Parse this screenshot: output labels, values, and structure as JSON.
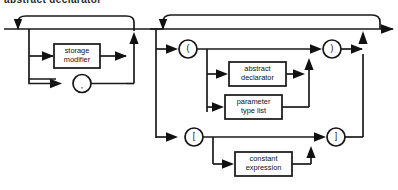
{
  "diagram": {
    "title": "abstract declarator",
    "type": "railroad-syntax-diagram",
    "ink_color": "#151515",
    "background_color": "#ffffff",
    "nodes": {
      "storage_modifier": "storage\nmodifier",
      "storage_modifier_line1": "storage",
      "storage_modifier_line2": "modifier",
      "abstract_declarator_line1": "abstract",
      "abstract_declarator_line2": "declarator",
      "parameter_type_list_line1": "parameter",
      "parameter_type_list_line2": "type list",
      "constant_expression_line1": "constant",
      "constant_expression_line2": "expression"
    },
    "terminals": {
      "comma": ",",
      "lparen": "(",
      "rparen": ")",
      "lbracket": "[",
      "rbracket": "]"
    }
  }
}
